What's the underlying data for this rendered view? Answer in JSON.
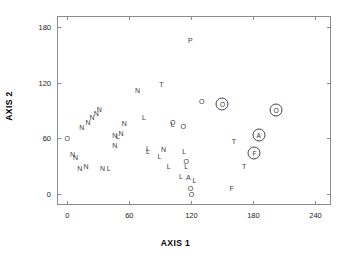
{
  "chart_data": {
    "type": "scatter",
    "title": "",
    "xlabel": "AXIS 1",
    "ylabel": "AXIS 2",
    "xlim": [
      -10,
      255
    ],
    "ylim": [
      -12,
      192
    ],
    "xticks": [
      0,
      60,
      120,
      180,
      240
    ],
    "yticks": [
      0,
      60,
      120,
      180
    ],
    "grid": false,
    "legend": null,
    "marker_style": "letter-labels; some points enclosed in a circle",
    "points": [
      {
        "label": "P",
        "x": 119,
        "y": 166,
        "circled": false
      },
      {
        "label": "T",
        "x": 91,
        "y": 119,
        "circled": false
      },
      {
        "label": "N",
        "x": 68,
        "y": 112,
        "circled": false
      },
      {
        "label": "O",
        "x": 130,
        "y": 100,
        "circled": false
      },
      {
        "label": "O",
        "x": 150,
        "y": 97,
        "circled": true
      },
      {
        "label": "O",
        "x": 202,
        "y": 91,
        "circled": true
      },
      {
        "label": "N",
        "x": 31,
        "y": 92,
        "circled": false
      },
      {
        "label": "N",
        "x": 28,
        "y": 87,
        "circled": false
      },
      {
        "label": "N",
        "x": 24,
        "y": 83,
        "circled": false
      },
      {
        "label": "L",
        "x": 74,
        "y": 83,
        "circled": false
      },
      {
        "label": "N",
        "x": 20,
        "y": 78,
        "circled": false
      },
      {
        "label": "N",
        "x": 55,
        "y": 77,
        "circled": false
      },
      {
        "label": "O",
        "x": 102,
        "y": 78,
        "circled": false
      },
      {
        "label": "L",
        "x": 102,
        "y": 75,
        "circled": false
      },
      {
        "label": "O",
        "x": 112,
        "y": 73,
        "circled": false
      },
      {
        "label": "N",
        "x": 14,
        "y": 72,
        "circled": false
      },
      {
        "label": "A",
        "x": 185,
        "y": 64,
        "circled": true
      },
      {
        "label": "N",
        "x": 52,
        "y": 66,
        "circled": false
      },
      {
        "label": "N",
        "x": 46,
        "y": 64,
        "circled": false
      },
      {
        "label": "L",
        "x": 49,
        "y": 62,
        "circled": false
      },
      {
        "label": "O",
        "x": 0,
        "y": 60,
        "circled": false
      },
      {
        "label": "T",
        "x": 161,
        "y": 57,
        "circled": false
      },
      {
        "label": "N",
        "x": 46,
        "y": 53,
        "circled": false
      },
      {
        "label": "L",
        "x": 78,
        "y": 50,
        "circled": false
      },
      {
        "label": "L",
        "x": 78,
        "y": 46,
        "circled": false
      },
      {
        "label": "N",
        "x": 93,
        "y": 48,
        "circled": false
      },
      {
        "label": "L",
        "x": 113,
        "y": 46,
        "circled": false
      },
      {
        "label": "F",
        "x": 181,
        "y": 44,
        "circled": true
      },
      {
        "label": "N",
        "x": 5,
        "y": 43,
        "circled": false
      },
      {
        "label": "N",
        "x": 8,
        "y": 40,
        "circled": false
      },
      {
        "label": "L",
        "x": 89,
        "y": 41,
        "circled": false
      },
      {
        "label": "O",
        "x": 115,
        "y": 36,
        "circled": false
      },
      {
        "label": "L",
        "x": 115,
        "y": 30,
        "circled": false
      },
      {
        "label": "N",
        "x": 12,
        "y": 28,
        "circled": false
      },
      {
        "label": "N",
        "x": 18,
        "y": 30,
        "circled": false
      },
      {
        "label": "N",
        "x": 34,
        "y": 28,
        "circled": false
      },
      {
        "label": "L",
        "x": 40,
        "y": 28,
        "circled": false
      },
      {
        "label": "L",
        "x": 98,
        "y": 30,
        "circled": false
      },
      {
        "label": "T",
        "x": 171,
        "y": 30,
        "circled": false
      },
      {
        "label": "L",
        "x": 110,
        "y": 19,
        "circled": false
      },
      {
        "label": "A",
        "x": 117,
        "y": 18,
        "circled": false
      },
      {
        "label": "L",
        "x": 123,
        "y": 15,
        "circled": false
      },
      {
        "label": "F",
        "x": 159,
        "y": 6,
        "circled": false
      },
      {
        "label": "O",
        "x": 119,
        "y": 6,
        "circled": false
      },
      {
        "label": "O",
        "x": 120,
        "y": 0,
        "circled": false
      }
    ]
  },
  "axes": {
    "x_tick_labels": [
      "0",
      "60",
      "120",
      "180",
      "240"
    ],
    "y_tick_labels": [
      "0",
      "60",
      "120",
      "180"
    ],
    "x_title": "AXIS 1",
    "y_title": "AXIS 2"
  }
}
